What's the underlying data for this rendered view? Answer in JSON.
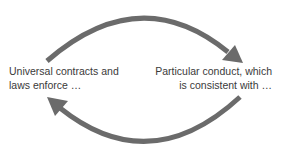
{
  "diagram": {
    "type": "cycle",
    "nodes": [
      {
        "id": "left",
        "lines": [
          "Universal contracts and",
          "laws enforce …"
        ]
      },
      {
        "id": "right",
        "lines": [
          "Particular conduct, which",
          "is consistent with …"
        ]
      }
    ],
    "edges": [
      {
        "from": "left",
        "to": "right",
        "path": "top-arc"
      },
      {
        "from": "right",
        "to": "left",
        "path": "bottom-arc"
      }
    ],
    "colors": {
      "arrow": "#6b6b6b",
      "text": "#3a3a3a",
      "background": "#ffffff"
    }
  }
}
